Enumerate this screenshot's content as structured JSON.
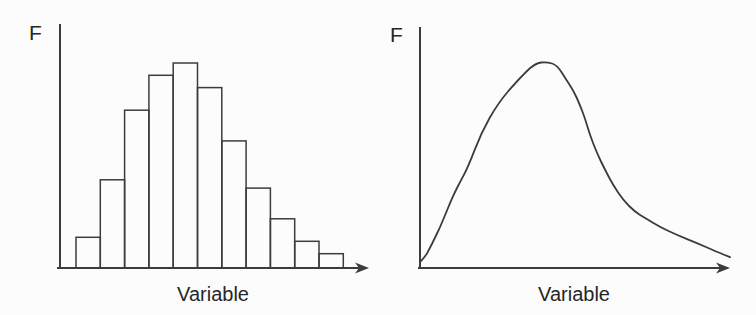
{
  "figure": {
    "background": "#fcfcfc",
    "line_color": "#3c3c3c",
    "text_color": "#262626"
  },
  "chart_data": [
    {
      "type": "bar",
      "title": "",
      "xlabel": "Variable",
      "ylabel": "F",
      "categories": [
        1,
        2,
        3,
        4,
        5,
        6,
        7,
        8,
        9,
        10,
        11
      ],
      "values": [
        0.15,
        0.43,
        0.77,
        0.94,
        1.0,
        0.88,
        0.62,
        0.39,
        0.24,
        0.13,
        0.07
      ],
      "ylim": [
        0,
        1.05
      ],
      "xlim": [
        0,
        12
      ],
      "grid": false,
      "bar_fill": "none",
      "tick_labels_shown": false
    },
    {
      "type": "line",
      "title": "",
      "xlabel": "Variable",
      "ylabel": "F",
      "x": [
        0.0,
        0.016,
        0.032,
        0.048,
        0.065,
        0.081,
        0.097,
        0.113,
        0.129,
        0.155,
        0.197,
        0.252,
        0.316,
        0.371,
        0.41,
        0.442,
        0.468,
        0.494,
        0.516,
        0.532,
        0.548,
        0.571,
        0.597,
        0.623,
        0.655,
        0.694,
        0.726,
        0.774,
        0.829,
        0.894,
        0.958,
        1.0
      ],
      "y": [
        0.029,
        0.053,
        0.097,
        0.146,
        0.199,
        0.257,
        0.316,
        0.369,
        0.417,
        0.49,
        0.655,
        0.801,
        0.913,
        0.995,
        1.0,
        0.985,
        0.922,
        0.864,
        0.791,
        0.728,
        0.646,
        0.558,
        0.476,
        0.403,
        0.33,
        0.272,
        0.243,
        0.199,
        0.16,
        0.121,
        0.078,
        0.053
      ],
      "xlim": [
        0,
        1
      ],
      "ylim": [
        0,
        1.05
      ],
      "grid": false,
      "tick_labels_shown": false
    }
  ]
}
